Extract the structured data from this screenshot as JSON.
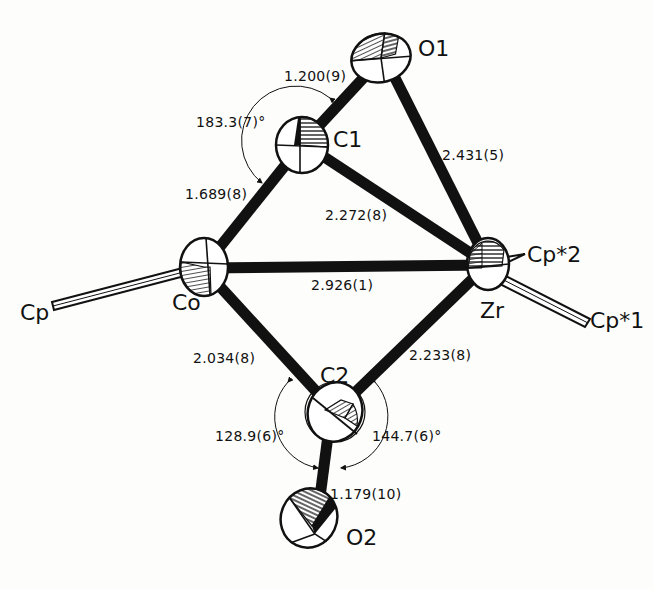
{
  "diagram": {
    "colors": {
      "ink": "#111111",
      "background": "#fdfdfb",
      "hatch": "#222222"
    },
    "atoms": [
      {
        "id": "O1",
        "label": "O1",
        "x": 380,
        "y": 60
      },
      {
        "id": "C1",
        "label": "C1",
        "x": 303,
        "y": 143
      },
      {
        "id": "Co",
        "label": "Co",
        "x": 203,
        "y": 268
      },
      {
        "id": "Zr",
        "label": "Zr",
        "x": 487,
        "y": 265
      },
      {
        "id": "C2",
        "label": "C2",
        "x": 335,
        "y": 412
      },
      {
        "id": "O2",
        "label": "O2",
        "x": 317,
        "y": 520
      }
    ],
    "ligands": [
      {
        "id": "Cp",
        "label": "Cp"
      },
      {
        "id": "Cp2",
        "label": "Cp*2"
      },
      {
        "id": "Cp1",
        "label": "Cp*1"
      }
    ],
    "bonds": [
      {
        "from": "C1",
        "to": "O1",
        "label": "1.200(9)"
      },
      {
        "from": "O1",
        "to": "Zr",
        "label": "2.431(5)"
      },
      {
        "from": "C1",
        "to": "Zr",
        "label": "2.272(8)"
      },
      {
        "from": "Co",
        "to": "C1",
        "label": "1.689(8)"
      },
      {
        "from": "Co",
        "to": "Zr",
        "label": "2.926(1)"
      },
      {
        "from": "Co",
        "to": "C2",
        "label": "2.034(8)"
      },
      {
        "from": "C2",
        "to": "Zr",
        "label": "2.233(8)"
      },
      {
        "from": "C2",
        "to": "O2",
        "label": "1.179(10)"
      }
    ],
    "angles": [
      {
        "atoms": "Co-C1-O1",
        "label": "183.3(7)°"
      },
      {
        "atoms": "Co-C2-O2",
        "label": "128.9(6)°"
      },
      {
        "atoms": "Zr-C2-O2",
        "label": "144.7(6)°"
      }
    ]
  }
}
